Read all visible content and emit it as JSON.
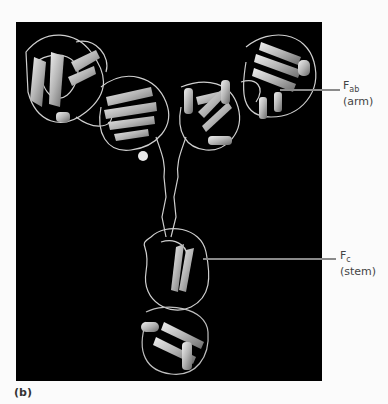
{
  "figure": {
    "panel_letter": "(b)",
    "image_description": "Ribbon model of antibody (IgG) molecular structure on black background",
    "labels": [
      {
        "main": "F",
        "sub": "ab",
        "desc": "(arm)"
      },
      {
        "main": "F",
        "sub": "c",
        "desc": "(stem)"
      }
    ]
  },
  "colors": {
    "background": "#fbfbfb",
    "panel": "#000000",
    "leader_line": "#8a8a8a",
    "label_text": "#444444"
  }
}
